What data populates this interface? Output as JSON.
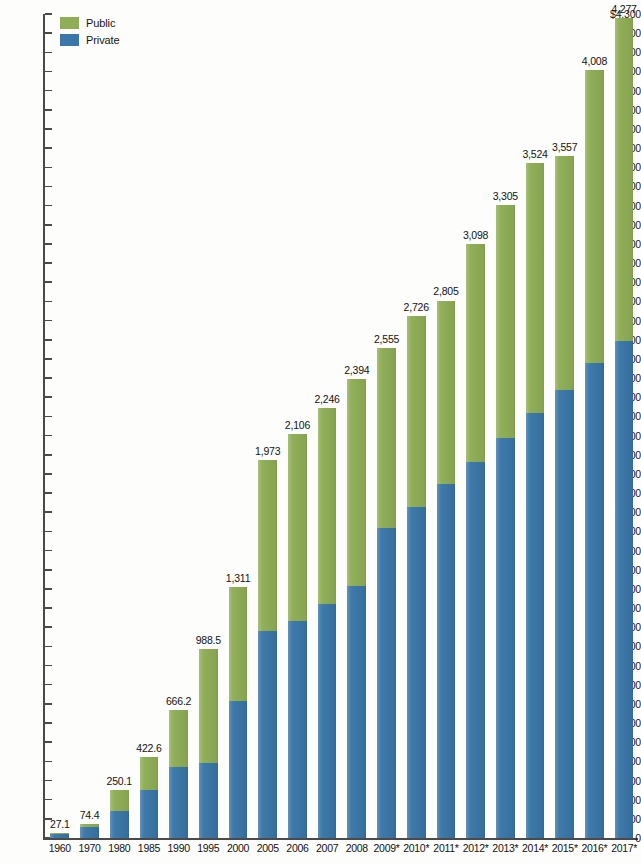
{
  "legend": {
    "position": "top-left",
    "items": [
      {
        "label": "Public",
        "color": "#8fae56",
        "key": "public"
      },
      {
        "label": "Private",
        "color": "#3a77a8",
        "key": "private"
      }
    ]
  },
  "axis": {
    "y_top_label": "$4,300",
    "y_zero_label": "0",
    "tick_step": 100,
    "ticks": [
      "$4,300",
      "4,200",
      "4,100",
      "4,000",
      "3,900",
      "3,800",
      "3,700",
      "3,600",
      "3,500",
      "3,400",
      "3,300",
      "3,200",
      "3,100",
      "3,000",
      "2,900",
      "2,800",
      "2,700",
      "2,600",
      "2,500",
      "2,400",
      "2,300",
      "2,200",
      "2,100",
      "2,000",
      "1,900",
      "1,800",
      "1,700",
      "1,600",
      "1,500",
      "1,400",
      "1,300",
      "1,200",
      "1,100",
      "1,000",
      "900",
      "800",
      "700",
      "600",
      "500",
      "400",
      "300",
      "200",
      "100",
      "0"
    ]
  },
  "chart_data": {
    "type": "bar",
    "subtype": "stacked-vertical",
    "title": "",
    "subtitle": "",
    "xlabel": "",
    "ylabel": "",
    "ylim": [
      0,
      4300
    ],
    "ytick_step": 100,
    "grid": false,
    "legend_position": "top-left",
    "annotation": "* Years 2009 through 2017 are marked with an asterisk",
    "categories": [
      "1960",
      "1970",
      "1980",
      "1985",
      "1990",
      "1995",
      "2000",
      "2005",
      "2006",
      "2007",
      "2008",
      "2009*",
      "2010*",
      "2011*",
      "2012*",
      "2013*",
      "2014*",
      "2015*",
      "2016*",
      "2017*"
    ],
    "totals": [
      27.1,
      74.4,
      250.1,
      422.6,
      666.2,
      988.5,
      1311,
      1973,
      2106,
      2246,
      2394,
      2555,
      2726,
      2805,
      3098,
      3305,
      3524,
      3557,
      4008,
      4277
    ],
    "total_labels": [
      "27.1",
      "74.4",
      "250.1",
      "422.6",
      "666.2",
      "988.5",
      "1,311",
      "1,973",
      "2,106",
      "2,246",
      "2,394",
      "2,555",
      "2,726",
      "2,805",
      "3,098",
      "3,305",
      "3,524",
      "3,557",
      "4,008",
      "4,277"
    ],
    "series": [
      {
        "name": "Private",
        "color": "#3a77a8",
        "values": [
          20,
          55,
          140,
          248,
          368,
          390,
          717,
          1079,
          1132,
          1222,
          1313,
          1617,
          1728,
          1846,
          1963,
          2090,
          2219,
          2340,
          2480,
          2592
        ]
      },
      {
        "name": "Public",
        "color": "#8fae56",
        "values": [
          7.1,
          19.4,
          110.1,
          174.6,
          298.2,
          598.5,
          594,
          894,
          974,
          1024,
          1081,
          938,
          998,
          959,
          1135,
          1215,
          1305,
          1217,
          1528,
          1685
        ]
      }
    ]
  }
}
